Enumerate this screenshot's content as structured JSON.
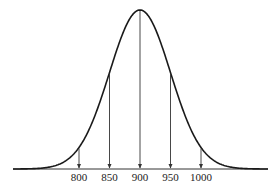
{
  "chart_data": {
    "type": "line",
    "title": "",
    "xlabel": "",
    "ylabel": "",
    "mean": 900,
    "std_dev": 50,
    "x_ticks": [
      "800",
      "850",
      "900",
      "950",
      "1000"
    ],
    "arrows_at": [
      800,
      850,
      900,
      950,
      1000
    ],
    "xlim": [
      725,
      1075
    ],
    "grid": false,
    "legend": null,
    "colors": {
      "curve": "#1a1a1a",
      "arrows": "#333333",
      "axis": "#333333"
    }
  }
}
